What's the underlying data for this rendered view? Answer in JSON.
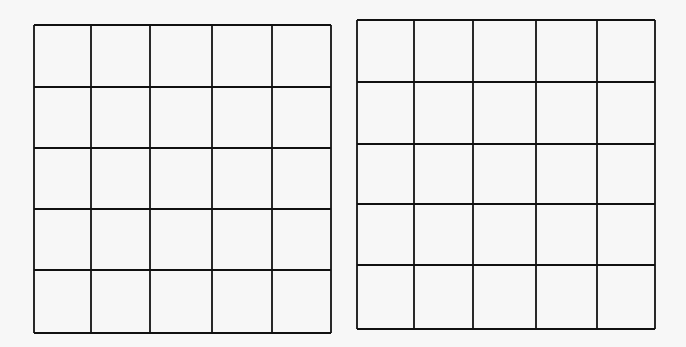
{
  "figure": {
    "grids": [
      {
        "name": "left-grid",
        "rows": 5,
        "cols": 5,
        "xs": [
          34,
          91,
          150,
          212,
          272,
          331
        ],
        "ys": [
          25,
          87,
          148,
          209,
          270,
          333
        ]
      },
      {
        "name": "right-grid",
        "rows": 5,
        "cols": 5,
        "xs": [
          357,
          414,
          473,
          536,
          597,
          655
        ],
        "ys": [
          20,
          82,
          144,
          204,
          265,
          329
        ]
      }
    ],
    "line_color": "#111111",
    "background": "#f7f7f7"
  }
}
